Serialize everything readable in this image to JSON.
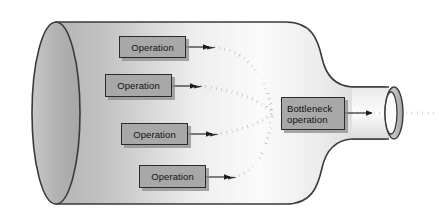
{
  "diagram": {
    "type": "process-flow",
    "container_shape": "bottle",
    "colors": {
      "bottle_fill_light": "#f2f2f2",
      "bottle_fill_mid": "#c9c9c9",
      "bottle_fill_dark": "#a9a9a9",
      "bottle_outline": "#3a3a3a",
      "box_fill": "#a8a8a8",
      "box_border": "#2b2b2b",
      "box_shadow": "#8c8c8c",
      "arrow_solid": "#1a1a1a",
      "arrow_dotted": "#404040",
      "text": "#111111",
      "background": "#ffffff"
    },
    "operations": [
      {
        "label": "Operation",
        "x": 119,
        "y": 36,
        "w": 67,
        "h": 22
      },
      {
        "label": "Operation",
        "x": 105,
        "y": 74,
        "w": 67,
        "h": 23
      },
      {
        "label": "Operation",
        "x": 121,
        "y": 123,
        "w": 67,
        "h": 22
      },
      {
        "label": "Operation",
        "x": 139,
        "y": 165,
        "w": 67,
        "h": 23
      }
    ],
    "bottleneck": {
      "label_line1": "Bottleneck",
      "label_line2": "operation",
      "x": 281,
      "y": 97,
      "w": 64,
      "h": 33
    },
    "flow": {
      "converge_x": 272,
      "converge_y": 113,
      "solid_arrow_count": 5,
      "dotted_curve_count": 4,
      "output_direction": "right-through-bottle-neck"
    },
    "neck_ring": {
      "shape": "annulus-ellipse",
      "cx": 394,
      "cy": 113,
      "rx": 9,
      "ry": 26
    }
  }
}
